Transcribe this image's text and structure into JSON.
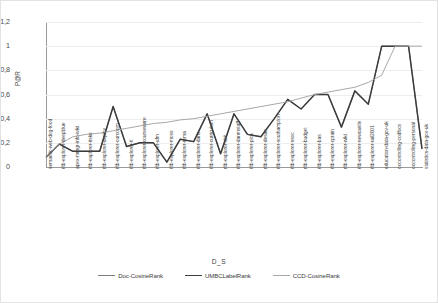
{
  "chart_data": {
    "type": "line",
    "title": "",
    "xlabel": "D_S",
    "ylabel": "P@R",
    "ylim": [
      0,
      1.2
    ],
    "yticks": [
      "0",
      "0,2",
      "0,4",
      "0,6",
      "0,8",
      "1",
      "1,2"
    ],
    "ytick_values": [
      0,
      0.2,
      0.4,
      0.6,
      0.8,
      1.0,
      1.2
    ],
    "grid": true,
    "legend_position": "bottom",
    "categories": [
      "semantic-web-dog-food",
      "rltb-explorer-deepblue",
      "apex-mmgr-info-wiki",
      "rltb-explorer-risks",
      "rltb-explorer-deploy",
      "rltb-explorer-ourcoom",
      "rltb-explorer-rt",
      "rltb-explorer-courseware",
      "rltb-explorer-ufm",
      "rltb-explorer-moss",
      "rltb-explorer-roma",
      "rltb-explorer-dans",
      "rltb-explorer-curriculum",
      "rltb-explorer-sirit",
      "rltb-explorer-danmstaff",
      "rltb-explorer-pica",
      "rltb-explorer-desac",
      "rltb-explorer-southampton",
      "rltb-explorer-ssoc",
      "rltb-explorer-budget",
      "rltb-explorer-bas",
      "rltb-explorer-cprain",
      "rltb-explorer-wiki",
      "rltb-explorer-newcastle",
      "rltb-explorer-rail2001",
      "education-data-gov-uk",
      "oocontrolling-codfocs",
      "oocontrolling-personal",
      "statistics-data-gov-uk"
    ],
    "series": [
      {
        "name": "Doc-CosineRank",
        "color": "#7f7f7f",
        "width": 1.0,
        "values": [
          0.08,
          0.19,
          0.13,
          0.13,
          0.13,
          0.5,
          0.17,
          0.2,
          0.2,
          0.04,
          0.23,
          0.21,
          0.44,
          0.11,
          0.44,
          0.27,
          0.25,
          0.4,
          0.56,
          0.48,
          0.6,
          0.6,
          0.33,
          0.63,
          0.52,
          1.0,
          1.0,
          1.0,
          0.15
        ]
      },
      {
        "name": "UMBCLabelRank",
        "color": "#3c3c3c",
        "width": 1.5,
        "values": [
          0.08,
          0.19,
          0.13,
          0.13,
          0.13,
          0.5,
          0.17,
          0.2,
          0.2,
          0.04,
          0.23,
          0.21,
          0.44,
          0.11,
          0.44,
          0.27,
          0.25,
          0.4,
          0.56,
          0.48,
          0.6,
          0.6,
          0.33,
          0.63,
          0.52,
          1.0,
          1.0,
          1.0,
          0.15
        ]
      },
      {
        "name": "CCD-CosineRank",
        "color": "#a8a8a8",
        "width": 1.0,
        "values": [
          0.08,
          0.19,
          0.25,
          0.27,
          0.28,
          0.3,
          0.32,
          0.34,
          0.36,
          0.37,
          0.39,
          0.4,
          0.42,
          0.44,
          0.46,
          0.48,
          0.5,
          0.52,
          0.54,
          0.57,
          0.6,
          0.62,
          0.64,
          0.66,
          0.7,
          0.76,
          1.0,
          1.0,
          1.0
        ]
      }
    ],
    "legend": [
      "Doc-CosineRank",
      "UMBCLabelRank",
      "CCD-CosineRank"
    ]
  }
}
